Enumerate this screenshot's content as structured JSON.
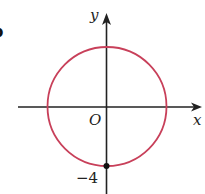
{
  "figure": {
    "part_label": "b",
    "axes": {
      "x_label": "x",
      "y_label": "y",
      "origin_label": "O"
    },
    "circle": {
      "center": [
        0,
        0
      ],
      "radius": 4,
      "color": "#c8405a"
    },
    "marked_point": {
      "coords": [
        0,
        -4
      ],
      "label": "−4"
    },
    "axis_color": "#222222"
  }
}
